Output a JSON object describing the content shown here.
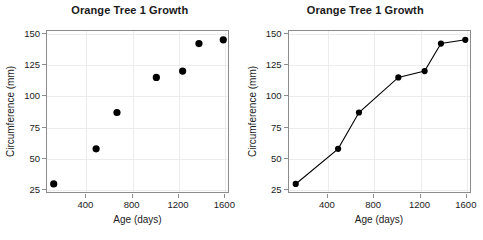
{
  "figure": {
    "background_color": "#ffffff",
    "panel_border_color": "#8c8c8c",
    "grid_color": "#ececec",
    "point_color": "#000000",
    "line_color": "#000000"
  },
  "panels": [
    {
      "id": "scatter-panel",
      "title": "Orange Tree 1 Growth",
      "xlabel": "Age (days)",
      "ylabel": "Circumference (mm)"
    },
    {
      "id": "line-panel",
      "title": "Orange Tree 1 Growth",
      "xlabel": "Age (days)",
      "ylabel": "Circumference (mm)"
    }
  ],
  "axes": {
    "x_ticks": [
      400,
      800,
      1200,
      1600
    ],
    "x_tick_labels": [
      "400",
      "800",
      "1200",
      "1600"
    ],
    "y_ticks": [
      25,
      50,
      75,
      100,
      125,
      150
    ],
    "y_tick_labels": [
      "25",
      "50",
      "75",
      "100",
      "125",
      "150"
    ],
    "xlim": [
      60,
      1640
    ],
    "ylim": [
      22,
      152
    ]
  },
  "chart_data": [
    {
      "type": "scatter",
      "title": "Orange Tree 1 Growth",
      "xlabel": "Age (days)",
      "ylabel": "Circumference (mm)",
      "x": [
        118,
        484,
        664,
        1004,
        1231,
        1372,
        1582
      ],
      "y": [
        30,
        58,
        87,
        115,
        120,
        142,
        145
      ],
      "xlim": [
        60,
        1640
      ],
      "ylim": [
        22,
        152
      ],
      "xticks": [
        400,
        800,
        1200,
        1600
      ],
      "yticks": [
        25,
        50,
        75,
        100,
        125,
        150
      ],
      "grid": true,
      "legend": false,
      "marker": "filled-circle",
      "marker_color": "#000000"
    },
    {
      "type": "line",
      "title": "Orange Tree 1 Growth",
      "xlabel": "Age (days)",
      "ylabel": "Circumference (mm)",
      "x": [
        118,
        484,
        664,
        1004,
        1231,
        1372,
        1582
      ],
      "series": [
        {
          "name": "Tree 1",
          "values": [
            30,
            58,
            87,
            115,
            120,
            142,
            145
          ]
        }
      ],
      "xlim": [
        60,
        1640
      ],
      "ylim": [
        22,
        152
      ],
      "xticks": [
        400,
        800,
        1200,
        1600
      ],
      "yticks": [
        25,
        50,
        75,
        100,
        125,
        150
      ],
      "grid": true,
      "legend": false,
      "marker": "filled-circle",
      "marker_color": "#000000",
      "line_color": "#000000"
    }
  ]
}
